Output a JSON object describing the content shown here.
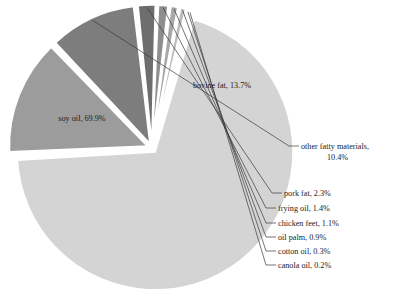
{
  "chart_data": {
    "type": "pie",
    "title": "",
    "subtitle": "",
    "xlabel": "",
    "ylabel": "",
    "legend_position": "none",
    "grid": false,
    "units": "percent",
    "total": 100.0,
    "categories": [
      "soy oil",
      "bovine fat",
      "other fatty materials",
      "pork fat",
      "frying oil",
      "chicken feet",
      "oil palm",
      "cotton oil",
      "canola oil"
    ],
    "values": [
      69.9,
      13.7,
      10.4,
      2.3,
      1.4,
      1.1,
      0.9,
      0.3,
      0.2
    ],
    "slices": [
      {
        "name": "soy oil",
        "value": 69.9,
        "label": "soy oil, 69.9%",
        "color": "#d4d4d4",
        "label_placement": "inside",
        "label_x": 82,
        "label_y": 121
      },
      {
        "name": "bovine fat",
        "value": 13.7,
        "label": "bovine fat, 13.7%",
        "color": "#9c9c9c",
        "label_placement": "inside",
        "label_x": 222,
        "label_y": 88
      },
      {
        "name": "other fatty materials",
        "value": 10.4,
        "label": "other fatty materials,",
        "label_line2": "10.4%",
        "color": "#7d7d7d",
        "label_placement": "callout",
        "label_x": 301,
        "label_y": 149
      },
      {
        "name": "pork fat",
        "value": 2.3,
        "label": "pork fat, 2.3%",
        "color": "#6e6e6e",
        "label_placement": "callout",
        "label_x": 284,
        "label_y": 196
      },
      {
        "name": "frying oil",
        "value": 1.4,
        "label": "frying oil, 1.4%",
        "color": "#8e8e8e",
        "label_placement": "callout",
        "label_x": 278,
        "label_y": 211
      },
      {
        "name": "chicken feet",
        "value": 1.1,
        "label": "chicken feet, 1.1%",
        "color": "#a8a8a8",
        "label_placement": "callout",
        "label_x": 278,
        "label_y": 226
      },
      {
        "name": "oil palm",
        "value": 0.9,
        "label": "oil palm, 0.9%",
        "color": "#bcbcbc",
        "label_placement": "callout",
        "label_x": 278,
        "label_y": 240
      },
      {
        "name": "cotton oil",
        "value": 0.3,
        "label": "cotton oil, 0.3%",
        "color": "#cdcdcd",
        "label_placement": "callout",
        "label_x": 278,
        "label_y": 254
      },
      {
        "name": "canola oil",
        "value": 0.2,
        "label": "canola oil, 0.2%",
        "color": "#dcdcdc",
        "label_placement": "callout",
        "label_x": 278,
        "label_y": 268
      }
    ]
  },
  "style": {
    "background": "#ffffff",
    "separator_color": "#ffffff",
    "text_color": "#1c1c1c",
    "leader_color": "#3a3a3a"
  },
  "geometry": {
    "center_x": 152,
    "center_y": 148,
    "radius": 138,
    "start_angle_deg": -74
  }
}
